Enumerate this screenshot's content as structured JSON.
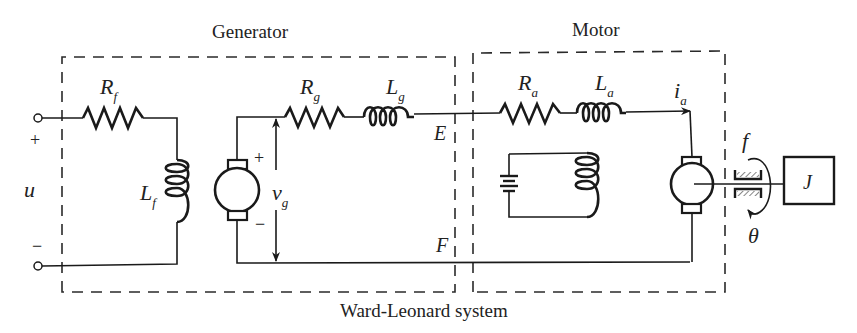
{
  "title": "Ward-Leonard system",
  "sections": {
    "generator": "Generator",
    "motor": "Motor"
  },
  "labels": {
    "input": "u",
    "input_plus": "+",
    "input_minus": "−",
    "Rf": {
      "base": "R",
      "sub": "f"
    },
    "Lf": {
      "base": "L",
      "sub": "f"
    },
    "Rg": {
      "base": "R",
      "sub": "g"
    },
    "Lg": {
      "base": "L",
      "sub": "g"
    },
    "vg": {
      "base": "v",
      "sub": "g"
    },
    "vg_plus": "+",
    "vg_minus": "−",
    "node_E": "E",
    "node_F": "F",
    "Ra": {
      "base": "R",
      "sub": "a"
    },
    "La": {
      "base": "L",
      "sub": "a"
    },
    "ia": {
      "base": "i",
      "sub": "a"
    },
    "friction": "f",
    "inertia": "J",
    "angle": "θ"
  }
}
